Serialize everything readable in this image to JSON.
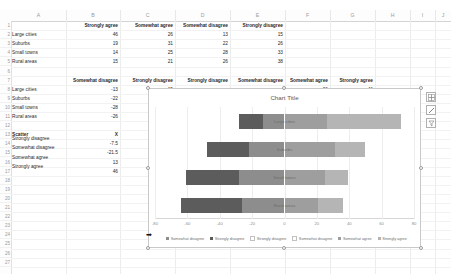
{
  "grid": {
    "columns": [
      "A",
      "B",
      "C",
      "D",
      "E",
      "F",
      "G",
      "H",
      "I",
      "J"
    ],
    "rows": [
      "1",
      "2",
      "3",
      "4",
      "5",
      "6",
      "7",
      "8",
      "9",
      "10",
      "11",
      "12",
      "13",
      "14",
      "15",
      "16",
      "17",
      "18",
      "19",
      "20",
      "21",
      "22",
      "23",
      "24",
      "25",
      "26",
      "27"
    ]
  },
  "table_top": {
    "headers": [
      "",
      "Strongly agree",
      "Somewhat agree",
      "Somewhat disagree",
      "Strongly disagree"
    ],
    "rows": [
      {
        "label": "Large cities",
        "values": [
          "46",
          "26",
          "13",
          "15"
        ]
      },
      {
        "label": "Suburbs",
        "values": [
          "19",
          "31",
          "22",
          "26"
        ]
      },
      {
        "label": "Small towns",
        "values": [
          "14",
          "25",
          "28",
          "33"
        ]
      },
      {
        "label": "Rural areas",
        "values": [
          "15",
          "21",
          "26",
          "38"
        ]
      }
    ]
  },
  "table_mid": {
    "headers": [
      "",
      "Somewhat disagree",
      "Strongly disagree",
      "Strongly disagree",
      "Somewhat disagree",
      "Somewhat agree",
      "Strongly agree"
    ],
    "rows": [
      {
        "label": "Large cities",
        "values": [
          "-13",
          "-15",
          "",
          "",
          "26",
          "46"
        ]
      },
      {
        "label": "Suburbs",
        "values": [
          "-22",
          "-26",
          "",
          "",
          "31",
          "19"
        ]
      },
      {
        "label": "Small towns",
        "values": [
          "-28",
          "",
          "",
          "",
          "",
          ""
        ]
      },
      {
        "label": "Rural areas",
        "values": [
          "-26",
          "",
          "",
          "",
          "",
          ""
        ]
      }
    ]
  },
  "table_scatter": {
    "title": "Scatter",
    "x_header": "X",
    "rows": [
      {
        "label": "Strongly disagree",
        "value": "-7.5"
      },
      {
        "label": "Somewhat disagree",
        "value": "-21.5"
      },
      {
        "label": "Somewhat agree",
        "value": "13"
      },
      {
        "label": "Strongly agree",
        "value": "46"
      }
    ]
  },
  "chart_data": {
    "type": "bar",
    "title": "Chart Title",
    "orientation": "horizontal",
    "stacked": "diverging",
    "categories": [
      "Large cities",
      "Suburbs",
      "Small towns",
      "Rural areas"
    ],
    "series": [
      {
        "name": "Somewhat disagree",
        "values": [
          -13,
          -22,
          -28,
          -26
        ],
        "color": "#8d8d8d"
      },
      {
        "name": "Strongly disagree",
        "values": [
          -15,
          -26,
          -33,
          -38
        ],
        "color": "#5c5c5c"
      },
      {
        "name": "Strongly disagree",
        "values": [
          0,
          0,
          0,
          0
        ],
        "color": "#ffffff"
      },
      {
        "name": "Somewhat disagree",
        "values": [
          0,
          0,
          0,
          0
        ],
        "color": "#ffffff"
      },
      {
        "name": "Somewhat agree",
        "values": [
          26,
          31,
          25,
          21
        ],
        "color": "#9e9e9e"
      },
      {
        "name": "Strongly agree",
        "values": [
          46,
          19,
          14,
          15
        ],
        "color": "#b5b5b5"
      }
    ],
    "xlabel": "",
    "ylabel": "",
    "xlim": [
      -80,
      80
    ],
    "xticks": [
      "-80",
      "-60",
      "-40",
      "-20",
      "0",
      "20",
      "40",
      "60",
      "80"
    ],
    "grid": true,
    "legend_position": "bottom"
  },
  "chart_buttons": [
    {
      "name": "chart-elements",
      "glyph": "+"
    },
    {
      "name": "chart-styles",
      "glyph": "brush"
    },
    {
      "name": "chart-filters",
      "glyph": "filter"
    }
  ]
}
